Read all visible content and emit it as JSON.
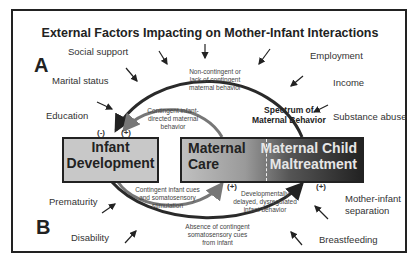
{
  "title": "External Factors Impacting on Mother-Infant Interactions",
  "panels": {
    "a": "A",
    "b": "B"
  },
  "factors_left_top": [
    "Social support",
    "Marital status",
    "Education"
  ],
  "factors_right_top": [
    "Employment",
    "Income",
    "Substance abuse"
  ],
  "factors_left_bottom": [
    "Prematurity",
    "Disability"
  ],
  "factors_right_bottom": [
    "Mother-infant separation",
    "Breastfeeding"
  ],
  "boxes": {
    "infant": [
      "Infant",
      "Development"
    ],
    "maternal_care": [
      "Maternal",
      "Care"
    ],
    "maltreatment": [
      "Maternal Child",
      "Maltreatment"
    ]
  },
  "spectrum": [
    "Spectrum of",
    "Maternal Behavior"
  ],
  "annotations": {
    "non_contingent": [
      "Non-contingent or",
      "lack of contingent",
      "maternal behavior"
    ],
    "contingent_directed": [
      "Contingent infant-",
      "directed maternal",
      "behavior"
    ],
    "contingent_cues": [
      "Contingent infant cues",
      "and somatosensory",
      "stimulation"
    ],
    "developmentally_delayed": [
      "Developmentally",
      "delayed, dysregulated",
      "infant behavior"
    ],
    "absence": [
      "Absence of contingent",
      "somatosensory cues",
      "from infant"
    ]
  },
  "signs": {
    "neg": "(-)",
    "pos": "(+)",
    "pos2": "(+)",
    "pos3": "(+)"
  },
  "colors": {
    "outer_arc": "#2a2a2a",
    "inner_arc": "#777777",
    "infant_box": "#c8c8c8"
  }
}
